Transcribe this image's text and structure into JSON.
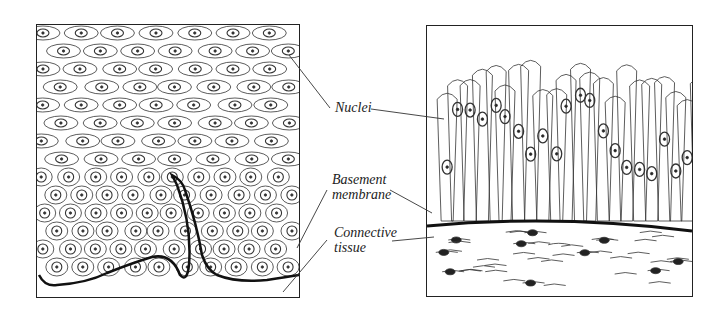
{
  "figure": {
    "left_panel": {
      "description": "Stratified squamous epithelium with basal papillae"
    },
    "right_panel": {
      "description": "Transitional/columnar stratified epithelium over connective tissue"
    },
    "labels": [
      {
        "id": "nuclei",
        "text": "Nuclei"
      },
      {
        "id": "basement",
        "line1": "Basement",
        "line2": "membrane"
      },
      {
        "id": "connective",
        "line1": "Connective",
        "line2": "tissue"
      }
    ]
  }
}
